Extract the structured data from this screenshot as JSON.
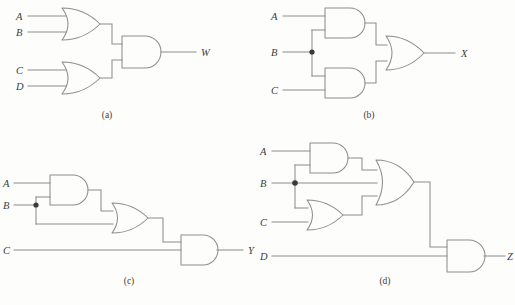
{
  "figure": {
    "background_color": "#fdfdfc",
    "line_color": "#8e8e8e",
    "text_color": "#3c3c3c",
    "junction_color": "#3a3a3a"
  },
  "circuits": [
    {
      "id": "a",
      "caption": "(a)",
      "output_label": "W",
      "expression": "W = (A + B) · (C + D)",
      "inputs": [
        "A",
        "B",
        "C",
        "D"
      ],
      "gates": [
        {
          "name": "or-gate-ab",
          "type": "OR",
          "inputs": [
            "A",
            "B"
          ]
        },
        {
          "name": "or-gate-cd",
          "type": "OR",
          "inputs": [
            "C",
            "D"
          ]
        },
        {
          "name": "and-gate-out",
          "type": "AND",
          "inputs": [
            "or-gate-ab",
            "or-gate-cd"
          ]
        }
      ],
      "junctions": []
    },
    {
      "id": "b",
      "caption": "(b)",
      "output_label": "X",
      "expression": "X = (A · B) + (B · C)",
      "inputs": [
        "A",
        "B",
        "C"
      ],
      "gates": [
        {
          "name": "and-gate-ab",
          "type": "AND",
          "inputs": [
            "A",
            "B"
          ]
        },
        {
          "name": "and-gate-bc",
          "type": "AND",
          "inputs": [
            "B",
            "C"
          ]
        },
        {
          "name": "or-gate-out",
          "type": "OR",
          "inputs": [
            "and-gate-ab",
            "and-gate-bc"
          ]
        }
      ],
      "junctions": [
        "B"
      ]
    },
    {
      "id": "c",
      "caption": "(c)",
      "output_label": "Y",
      "expression": "Y = ((A · B) + B) · C",
      "inputs": [
        "A",
        "B",
        "C"
      ],
      "gates": [
        {
          "name": "and-gate-ab",
          "type": "AND",
          "inputs": [
            "A",
            "B"
          ]
        },
        {
          "name": "or-gate-mid",
          "type": "OR",
          "inputs": [
            "and-gate-ab",
            "B"
          ]
        },
        {
          "name": "and-gate-out",
          "type": "AND",
          "inputs": [
            "or-gate-mid",
            "C"
          ]
        }
      ],
      "junctions": [
        "B"
      ]
    },
    {
      "id": "d",
      "caption": "(d)",
      "output_label": "Z",
      "expression": "Z = ((A · B) + B + (B + C)) · D",
      "inputs": [
        "A",
        "B",
        "C",
        "D"
      ],
      "gates": [
        {
          "name": "and-gate-ab",
          "type": "AND",
          "inputs": [
            "A",
            "B"
          ]
        },
        {
          "name": "or-gate-bc",
          "type": "OR",
          "inputs": [
            "B",
            "C"
          ]
        },
        {
          "name": "or-gate-mid",
          "type": "OR",
          "inputs": [
            "and-gate-ab",
            "B",
            "or-gate-bc"
          ]
        },
        {
          "name": "and-gate-out",
          "type": "AND",
          "inputs": [
            "or-gate-mid",
            "D"
          ]
        }
      ],
      "junctions": [
        "B"
      ]
    }
  ],
  "labels": {
    "a": {
      "in0": "A",
      "in1": "B",
      "in2": "C",
      "in3": "D",
      "out": "W",
      "caption": "(a)"
    },
    "b": {
      "in0": "A",
      "in1": "B",
      "in2": "C",
      "out": "X",
      "caption": "(b)"
    },
    "c": {
      "in0": "A",
      "in1": "B",
      "in2": "C",
      "out": "Y",
      "caption": "(c)"
    },
    "d": {
      "in0": "A",
      "in1": "B",
      "in2": "C",
      "in3": "D",
      "out": "Z",
      "caption": "(d)"
    }
  }
}
